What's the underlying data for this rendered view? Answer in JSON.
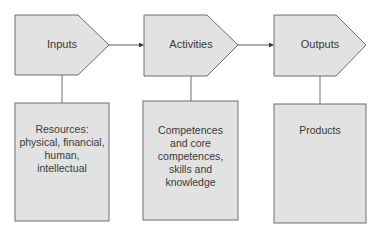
{
  "diagram": {
    "colors": {
      "fill": "#e2e2e2",
      "stroke": "#6e6e6e",
      "text": "#3a3a3a",
      "arrow": "#333333"
    },
    "stages": [
      {
        "label": "Inputs",
        "detail": "Resources: physical, financial, human, intellectual",
        "detail_lines": [
          "Resources:",
          "physical, financial,",
          "human,",
          "intellectual"
        ]
      },
      {
        "label": "Activities",
        "detail": "Competences and core competences, skills and knowledge",
        "detail_lines": [
          "Competences",
          "and core",
          "competences,",
          "skills and",
          "knowledge"
        ]
      },
      {
        "label": "Outputs",
        "detail": "Products",
        "detail_lines": [
          "Products"
        ]
      }
    ],
    "flow": [
      "Inputs -> Activities",
      "Activities -> Outputs"
    ]
  }
}
